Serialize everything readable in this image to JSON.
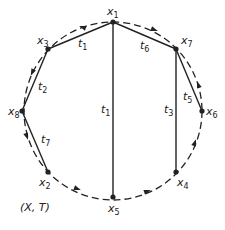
{
  "diagram": {
    "caption": "(X, T)",
    "colors": {
      "stroke": "#222222",
      "background": "#ffffff"
    },
    "circle": {
      "cx": 113,
      "cy": 111,
      "r": 89,
      "style": "dashed"
    },
    "nodes": [
      {
        "id": "x1",
        "base": "x",
        "sub": "1",
        "x": 113,
        "y": 22,
        "lx": 107,
        "ly": 15
      },
      {
        "id": "x3",
        "base": "x",
        "sub": "3",
        "x": 48,
        "y": 49,
        "lx": 37,
        "ly": 44
      },
      {
        "id": "x7",
        "base": "x",
        "sub": "7",
        "x": 176,
        "y": 49,
        "lx": 181,
        "ly": 44
      },
      {
        "id": "x8",
        "base": "x",
        "sub": "8",
        "x": 22,
        "y": 111,
        "lx": 8,
        "ly": 115
      },
      {
        "id": "x6",
        "base": "x",
        "sub": "6",
        "x": 202,
        "y": 111,
        "lx": 206,
        "ly": 115
      },
      {
        "id": "x2",
        "base": "x",
        "sub": "2",
        "x": 48,
        "y": 172,
        "lx": 39,
        "ly": 186
      },
      {
        "id": "x4",
        "base": "x",
        "sub": "4",
        "x": 176,
        "y": 172,
        "lx": 177,
        "ly": 186
      },
      {
        "id": "x5",
        "base": "x",
        "sub": "5",
        "x": 113,
        "y": 197,
        "lx": 108,
        "ly": 212
      }
    ],
    "edges": [
      {
        "from": "x3",
        "to": "x1",
        "base": "t",
        "sub": "1",
        "lx": 78,
        "ly": 47
      },
      {
        "from": "x1",
        "to": "x5",
        "base": "t",
        "sub": "1",
        "lx": 101,
        "ly": 113
      },
      {
        "from": "x3",
        "to": "x8",
        "base": "t",
        "sub": "2",
        "lx": 38,
        "ly": 90
      },
      {
        "from": "x8",
        "to": "x2",
        "base": "t",
        "sub": "7",
        "lx": 41,
        "ly": 143
      },
      {
        "from": "x1",
        "to": "x7",
        "base": "t",
        "sub": "6",
        "lx": 140,
        "ly": 49
      },
      {
        "from": "x7",
        "to": "x4",
        "base": "t",
        "sub": "3",
        "lx": 164,
        "ly": 113
      },
      {
        "from": "x7",
        "to": "x6",
        "base": "t",
        "sub": "5",
        "lx": 183,
        "ly": 100
      }
    ],
    "arrows": [
      {
        "x": 82,
        "y": 27,
        "angle": 200
      },
      {
        "x": 155,
        "y": 30,
        "angle": 20
      },
      {
        "x": 32,
        "y": 73,
        "angle": 115
      },
      {
        "x": 198,
        "y": 84,
        "angle": 250
      },
      {
        "x": 27,
        "y": 137,
        "angle": 70
      },
      {
        "x": 78,
        "y": 189,
        "angle": 20
      },
      {
        "x": 148,
        "y": 191,
        "angle": 340
      },
      {
        "x": 195,
        "y": 142,
        "angle": 290
      }
    ]
  }
}
